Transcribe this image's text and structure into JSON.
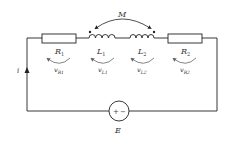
{
  "diagram": {
    "type": "circuit",
    "colors": {
      "wire": "#222222",
      "label": "#333333",
      "voltage_arrow": "#666666"
    },
    "mutual_inductance": {
      "label": "M"
    },
    "current": {
      "label": "i"
    },
    "source": {
      "label": "E",
      "plus": "+",
      "minus": "−"
    },
    "components": [
      {
        "id": "R1",
        "label_main": "R",
        "label_sub": "1",
        "voltage_main": "v",
        "voltage_sub": "R1"
      },
      {
        "id": "L1",
        "label_main": "L",
        "label_sub": "1",
        "voltage_main": "v",
        "voltage_sub": "L1"
      },
      {
        "id": "L2",
        "label_main": "L",
        "label_sub": "2",
        "voltage_main": "v",
        "voltage_sub": "L2"
      },
      {
        "id": "R2",
        "label_main": "R",
        "label_sub": "2",
        "voltage_main": "v",
        "voltage_sub": "R2"
      }
    ]
  }
}
